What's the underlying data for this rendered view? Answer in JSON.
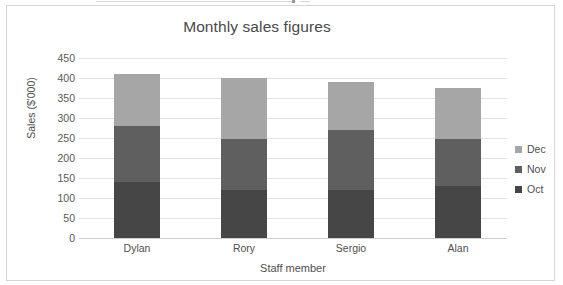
{
  "chart_data": {
    "type": "bar",
    "subtype": "stacked-column",
    "title": "Monthly sales figures",
    "xlabel": "Staff member",
    "ylabel": "Sales ($'000)",
    "categories": [
      "Dylan",
      "Rory",
      "Sergio",
      "Alan"
    ],
    "series": [
      {
        "name": "Oct",
        "values": [
          140,
          120,
          120,
          130
        ],
        "color": "#464646"
      },
      {
        "name": "Nov",
        "values": [
          140,
          128,
          150,
          118
        ],
        "color": "#5f5f5f"
      },
      {
        "name": "Dec",
        "values": [
          130,
          152,
          120,
          127
        ],
        "color": "#a6a6a6"
      }
    ],
    "stack_totals": [
      410,
      400,
      390,
      375
    ],
    "ylim": [
      0,
      450
    ],
    "ytick_step": 50,
    "yticks": [
      "450",
      "400",
      "350",
      "300",
      "250",
      "200",
      "150",
      "100",
      "50",
      "0"
    ],
    "grid": true,
    "legend_position": "right",
    "legend_order": [
      "Dec",
      "Nov",
      "Oct"
    ]
  },
  "legend": {
    "items": [
      {
        "label": "Dec",
        "color": "#a6a6a6"
      },
      {
        "label": "Nov",
        "color": "#5f5f5f"
      },
      {
        "label": "Oct",
        "color": "#464646"
      }
    ]
  },
  "colors": {
    "grid": "#e2e2e2",
    "axis": "#cfcfcf",
    "frame": "#d6d6d6",
    "text": "#4f4f4f",
    "background": "#ffffff"
  }
}
